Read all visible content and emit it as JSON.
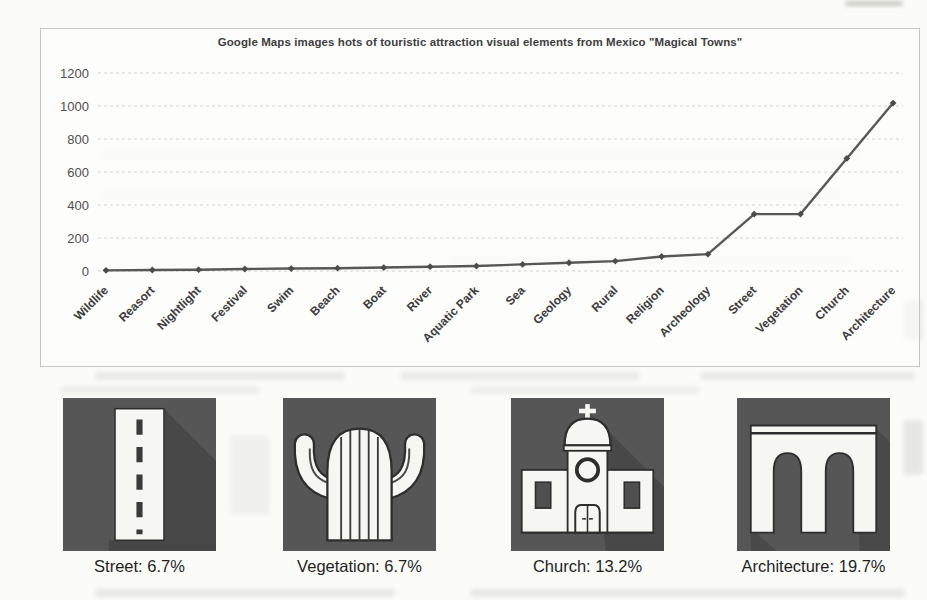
{
  "chart_data": {
    "type": "line",
    "title": "Google Maps images hots of touristic attraction visual elements from Mexico \"Magical Towns\"",
    "categories": [
      "Wildlife",
      "Reasort",
      "Nightlight",
      "Festival",
      "Swim",
      "Beach",
      "Boat",
      "River",
      "Aquatic Park",
      "Sea",
      "Geology",
      "Rural",
      "Religion",
      "Archeology",
      "Street",
      "Vegetation",
      "Church",
      "Architecture"
    ],
    "values": [
      4,
      6,
      8,
      12,
      15,
      17,
      21,
      26,
      30,
      40,
      50,
      60,
      88,
      102,
      345,
      345,
      682,
      1018
    ],
    "xlabel": "",
    "ylabel": "",
    "yticks": [
      0,
      200,
      400,
      600,
      800,
      1000,
      1200
    ],
    "ylim": [
      0,
      1200
    ],
    "grid": true,
    "gridline_style": "dashed",
    "legend_position": "none",
    "marker": "diamond"
  },
  "icon_cards": [
    {
      "icon": "street-icon",
      "category": "Street",
      "percent": "6.7%",
      "label": "Street: 6.7%"
    },
    {
      "icon": "vegetation-icon",
      "category": "Vegetation",
      "percent": "6.7%",
      "label": "Vegetation: 6.7%"
    },
    {
      "icon": "church-icon",
      "category": "Church",
      "percent": "13.2%",
      "label": "Church: 13.2%"
    },
    {
      "icon": "architecture-icon",
      "category": "Architecture",
      "percent": "19.7%",
      "label": "Architecture: 19.7%"
    }
  ],
  "colors": {
    "line": "#575757",
    "marker": "#4c4c4c",
    "grid": "#d2d2cf",
    "tile_bg": "#565656",
    "tile_shadow": "#484848",
    "icon_fill": "#f6f6f3",
    "icon_outline": "#2e2e2e"
  }
}
